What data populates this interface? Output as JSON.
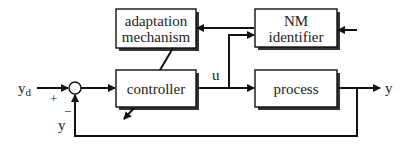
{
  "diagram": {
    "blocks": {
      "adaptation": {
        "line1": "adaptation",
        "line2": "mechanism"
      },
      "identifier": {
        "line1": "NM",
        "line2": "identifier"
      },
      "controller": {
        "label": "controller"
      },
      "process": {
        "label": "process"
      }
    },
    "signals": {
      "reference": "y",
      "reference_sub": "d",
      "control": "u",
      "output": "y",
      "feedback": "y"
    },
    "signs": {
      "plus": "+",
      "minus": "−"
    }
  }
}
